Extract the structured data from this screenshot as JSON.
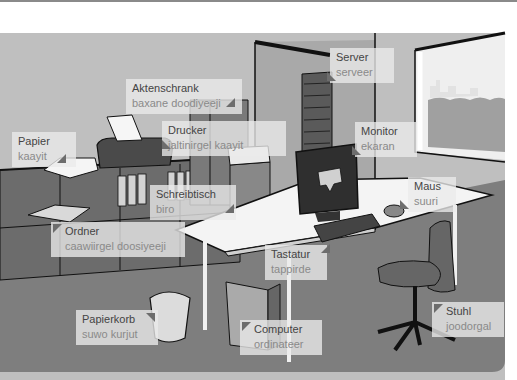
{
  "colors": {
    "wall": "#bdbdbd",
    "floor": "#808080",
    "label_bg": "#ebebeb",
    "label_de": "#444444",
    "label_so": "#8a8a8a",
    "marker": "#6d6d6d"
  },
  "labels": [
    {
      "id": "server",
      "de": "Server",
      "so": "serveer"
    },
    {
      "id": "aktenschrank",
      "de": "Aktenschrank",
      "so": "baxane doodiyeeji"
    },
    {
      "id": "drucker",
      "de": "Drucker",
      "so": "jaltinirgel kaayit"
    },
    {
      "id": "papier",
      "de": "Papier",
      "so": "kaayit"
    },
    {
      "id": "monitor",
      "de": "Monitor",
      "so": "ekaran"
    },
    {
      "id": "maus",
      "de": "Maus",
      "so": "suuri"
    },
    {
      "id": "schreibtisch",
      "de": "Schreibtisch",
      "so": "biro"
    },
    {
      "id": "ordner",
      "de": "Ordner",
      "so": "caawiirgel doosiyeeji"
    },
    {
      "id": "tastatur",
      "de": "Tastatur",
      "so": "tappirde"
    },
    {
      "id": "papierkorb",
      "de": "Papierkorb",
      "so": "suwo kurjut"
    },
    {
      "id": "computer",
      "de": "Computer",
      "so": "ordinateer"
    },
    {
      "id": "stuhl",
      "de": "Stuhl",
      "so": "joodorgal"
    }
  ]
}
